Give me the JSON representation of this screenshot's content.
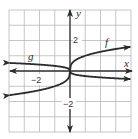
{
  "chart_data": {
    "type": "line",
    "title": "",
    "xlabel": "x",
    "ylabel": "y",
    "xlim": [
      -4,
      4
    ],
    "ylim": [
      -4,
      4
    ],
    "grid": true,
    "grid_step": 1,
    "tick_labels": {
      "x": [
        {
          "value": -2,
          "label": "−2"
        }
      ],
      "y": [
        {
          "value": 2,
          "label": "2"
        },
        {
          "value": -2,
          "label": "−2"
        }
      ]
    },
    "series": [
      {
        "name": "f",
        "description": "f(x) = cube root of x",
        "x": [
          -4,
          -3,
          -2,
          -1,
          -0.5,
          0,
          0.5,
          1,
          2,
          3,
          4
        ],
        "y": [
          -1.587,
          -1.442,
          -1.26,
          -1.0,
          -0.794,
          0,
          0.794,
          1.0,
          1.26,
          1.442,
          1.587
        ]
      },
      {
        "name": "g",
        "description": "g(x) = -(1/3)·cube root of x",
        "x": [
          -4,
          -3,
          -2,
          -1,
          -0.5,
          0,
          0.5,
          1,
          2,
          3,
          4
        ],
        "y": [
          0.529,
          0.481,
          0.42,
          0.333,
          0.265,
          0,
          -0.265,
          -0.333,
          -0.42,
          -0.481,
          -0.529
        ]
      }
    ],
    "annotations": [
      {
        "text": "f",
        "x": 2.6,
        "y": 2.0
      },
      {
        "text": "g",
        "x": -3.0,
        "y": 1.0
      }
    ],
    "legend": null
  },
  "labels": {
    "x_axis": "x",
    "y_axis": "y",
    "f": "f",
    "g": "g",
    "y_pos2": "2",
    "y_neg2": "−2",
    "x_neg2": "−2"
  },
  "colors": {
    "grid": "#b8b8b8",
    "axis": "#333333",
    "curve": "#2b2b2b"
  }
}
